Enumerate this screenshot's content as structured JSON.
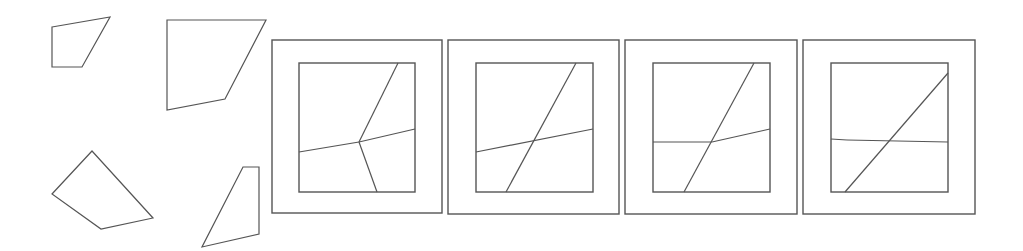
{
  "diagram": {
    "title": "",
    "stroke_color": "#555555",
    "background": "#ffffff",
    "pieces": [
      {
        "name": "piece-top-left",
        "points": [
          [
            52,
            27
          ],
          [
            110,
            17
          ],
          [
            82,
            67
          ],
          [
            52,
            67
          ]
        ]
      },
      {
        "name": "piece-top-right",
        "points": [
          [
            167,
            20
          ],
          [
            266,
            20
          ],
          [
            225,
            99
          ],
          [
            167,
            110
          ]
        ]
      },
      {
        "name": "piece-bottom-left",
        "points": [
          [
            92,
            151
          ],
          [
            153,
            218
          ],
          [
            101,
            229
          ],
          [
            52,
            194
          ]
        ]
      },
      {
        "name": "piece-bottom-right",
        "points": [
          [
            243,
            167
          ],
          [
            259,
            167
          ],
          [
            259,
            234
          ],
          [
            202,
            247
          ]
        ]
      }
    ],
    "panels": [
      {
        "name": "panel-1",
        "outer": [
          272,
          40,
          170,
          173
        ],
        "inner": [
          299,
          63,
          116,
          129
        ],
        "lines": [
          [
            [
              398,
              63
            ],
            [
              359,
              142
            ]
          ],
          [
            [
              299,
              152
            ],
            [
              359,
              142
            ]
          ],
          [
            [
              359,
              142
            ],
            [
              415,
              129
            ]
          ],
          [
            [
              359,
              142
            ],
            [
              377,
              192
            ]
          ]
        ]
      },
      {
        "name": "panel-2",
        "outer": [
          448,
          40,
          171,
          174
        ],
        "inner": [
          476,
          63,
          117,
          129
        ],
        "lines": [
          [
            [
              576,
              63
            ],
            [
              506,
              192
            ]
          ],
          [
            [
              476,
              152
            ],
            [
              593,
              129
            ]
          ]
        ]
      },
      {
        "name": "panel-3",
        "outer": [
          625,
          40,
          172,
          174
        ],
        "inner": [
          653,
          63,
          117,
          129
        ],
        "lines": [
          [
            [
              754,
              63
            ],
            [
              684,
              192
            ]
          ],
          [
            [
              653,
              142
            ],
            [
              712,
              142
            ]
          ],
          [
            [
              712,
              142
            ],
            [
              770,
              129
            ]
          ]
        ]
      },
      {
        "name": "panel-4",
        "outer": [
          803,
          40,
          172,
          174
        ],
        "inner": [
          831,
          63,
          117,
          129
        ],
        "lines": [
          [
            [
              948,
              73
            ],
            [
              845,
              192
            ]
          ],
          [
            [
              831,
              139
            ],
            [
              847,
              140
            ]
          ],
          [
            [
              847,
              140
            ],
            [
              948,
              142
            ]
          ]
        ]
      }
    ]
  }
}
